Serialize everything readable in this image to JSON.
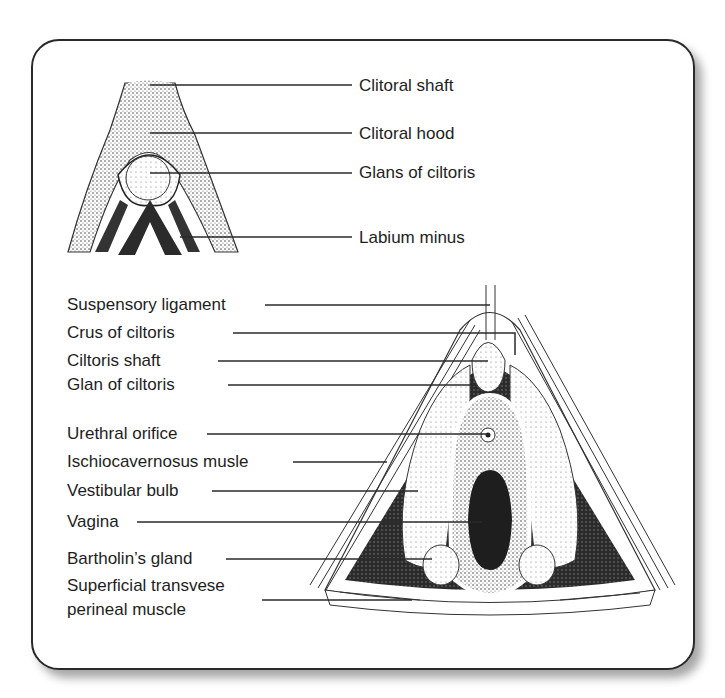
{
  "diagram": {
    "top_illustration": {
      "labels": [
        {
          "id": "clitoral-shaft",
          "text": "Clitoral shaft"
        },
        {
          "id": "clitoral-hood",
          "text": "Clitoral hood"
        },
        {
          "id": "glans-of-clitoris",
          "text": "Glans of ciltoris"
        },
        {
          "id": "labium-minus",
          "text": "Labium minus"
        }
      ]
    },
    "bottom_illustration": {
      "labels": [
        {
          "id": "suspensory-ligament",
          "text": "Suspensory ligament"
        },
        {
          "id": "crus-of-clitoris",
          "text": "Crus of ciltoris"
        },
        {
          "id": "clitoris-shaft",
          "text": "Ciltoris shaft"
        },
        {
          "id": "glan-of-clitoris",
          "text": "Glan of ciltoris"
        },
        {
          "id": "urethral-orifice",
          "text": "Urethral orifice"
        },
        {
          "id": "ischiocavernosus-muscle",
          "text": "Ischiocavernosus musle"
        },
        {
          "id": "vestibular-bulb",
          "text": "Vestibular bulb"
        },
        {
          "id": "vagina",
          "text": "Vagina"
        },
        {
          "id": "bartholins-gland",
          "text": "Bartholin’s gland"
        },
        {
          "id": "superficial-transverse-1",
          "text": "Superficial transvese"
        },
        {
          "id": "superficial-transverse-2",
          "text": "perineal muscle"
        }
      ]
    },
    "colors": {
      "line": "#2a2a2a",
      "text": "#1e1e1e",
      "dark_fill": "#2b2b2b",
      "tissue": "#e8e8e8"
    }
  }
}
